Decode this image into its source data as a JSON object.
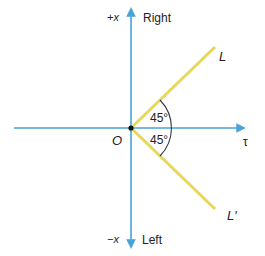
{
  "diagram": {
    "origin_label": "O",
    "top_axis": {
      "symbol": "+x",
      "word": "Right"
    },
    "bottom_axis": {
      "symbol": "−x",
      "word": "Left"
    },
    "horizontal_axis_label": "τ",
    "upper_line_label": "L",
    "lower_line_label": "L′",
    "upper_angle_label": "45°",
    "lower_angle_label": "45°",
    "colors": {
      "axis": "#4aa3d6",
      "lines": "#e6d85a",
      "arc": "#333a4a",
      "origin_dot": "#111111",
      "text": "#222222"
    }
  }
}
